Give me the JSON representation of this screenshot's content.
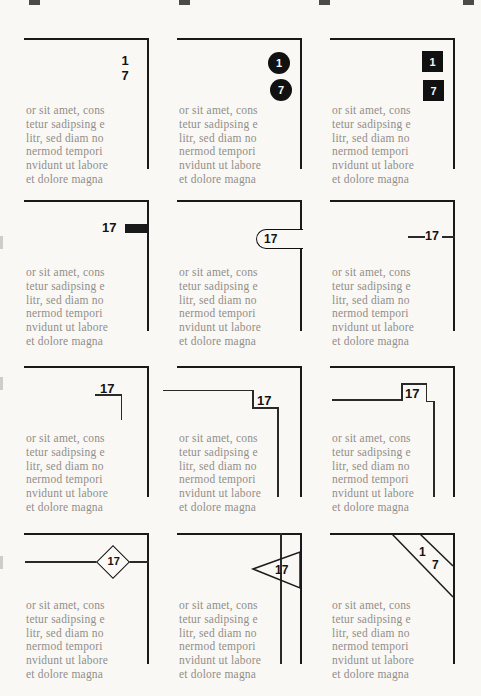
{
  "colors": {
    "background": "#f9f8f5",
    "rule_ink": "#1a1a1a",
    "number_black": "#141414",
    "muted_text": "#928e89"
  },
  "placeholder": {
    "lines": [
      "or sit amet, cons",
      "tetur sadipsing e",
      "litr, sed diam no",
      "nermod tempori",
      "nvidunt ut labore",
      "et dolore magna"
    ]
  },
  "cells": {
    "r1c1": {
      "style": "plain-stacked-digits",
      "digits": {
        "top": "1",
        "bottom": "7"
      }
    },
    "r1c2": {
      "style": "black-circle-digits",
      "digits": {
        "top": "1",
        "bottom": "7"
      }
    },
    "r1c3": {
      "style": "black-square-digits",
      "digits": {
        "top": "1",
        "bottom": "7"
      }
    },
    "r2c1": {
      "style": "number-with-black-bar",
      "page_number": "17"
    },
    "r2c2": {
      "style": "rounded-tab",
      "page_number": "17"
    },
    "r2c3": {
      "style": "rule-through-number",
      "page_number": "17"
    },
    "r3c1": {
      "style": "corner-bracket",
      "page_number": "17"
    },
    "r3c2": {
      "style": "stepped-rule-down",
      "page_number": "17"
    },
    "r3c3": {
      "style": "raised-notch-rule",
      "page_number": "17"
    },
    "r4c1": {
      "style": "diamond-on-rule",
      "page_number": "17"
    },
    "r4c2": {
      "style": "triangle-pointer",
      "page_number": "17"
    },
    "r4c3": {
      "style": "diagonal-corner-band",
      "digits": {
        "top": "1",
        "bottom": "7"
      }
    }
  }
}
